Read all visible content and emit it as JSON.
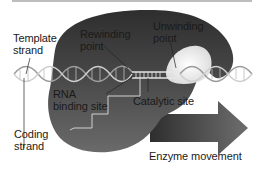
{
  "diagram": {
    "type": "RNA polymerase transcription bubble",
    "labels": {
      "template_strand": "Template\nstrand",
      "rewinding_point": "Rewinding\npoint",
      "unwinding_point": "Unwinding\npoint",
      "rna_binding_site": "RNA\nbinding site",
      "catalytic_site": "Catalytic site",
      "coding_strand": "Coding\nstrand",
      "enzyme_movement": "Enzyme movement"
    },
    "colors": {
      "enzyme_dark": "#3a3a3a",
      "enzyme_mid": "#5a5a5a",
      "dna_light": "#c8c8c8",
      "arrow": "#4a4a4a",
      "background": "#ffffff"
    }
  }
}
